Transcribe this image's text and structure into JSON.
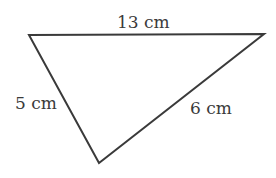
{
  "diagram": {
    "type": "triangle",
    "stroke_color": "#3a3a3a",
    "fill_color": "#ffffff",
    "vertices": {
      "top_left": [
        29,
        35
      ],
      "top_right": [
        264,
        34
      ],
      "bottom": [
        99,
        163
      ]
    },
    "sides": [
      {
        "id": "top",
        "label": "13 cm",
        "from": "top_left",
        "to": "top_right"
      },
      {
        "id": "left",
        "label": "5 cm",
        "from": "top_left",
        "to": "bottom"
      },
      {
        "id": "right",
        "label": "6 cm",
        "from": "bottom",
        "to": "top_right"
      }
    ]
  }
}
